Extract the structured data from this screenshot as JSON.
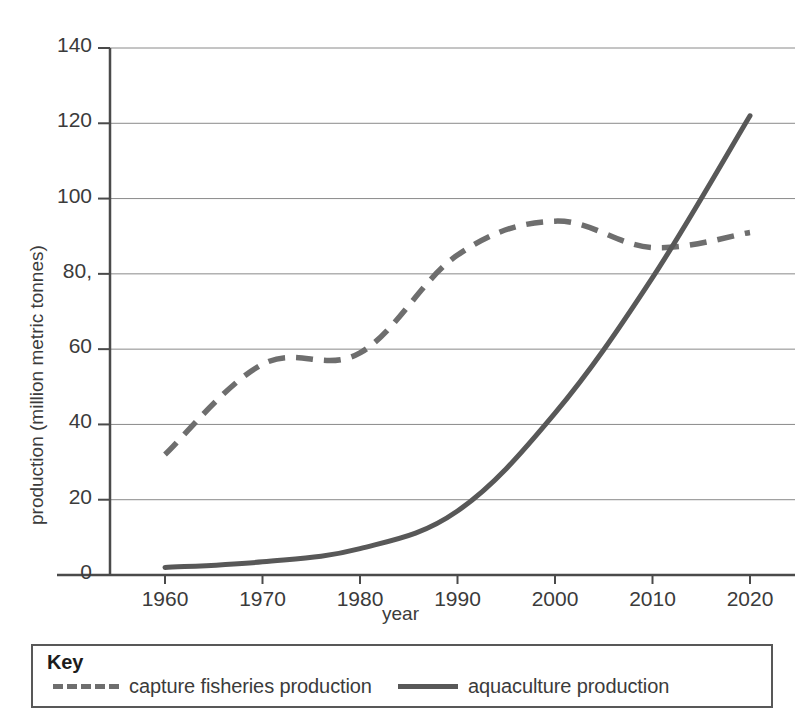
{
  "chart_data": {
    "type": "line",
    "title": "",
    "xlabel": "year",
    "ylabel": "production (million metric tonnes)",
    "x": [
      1960,
      1970,
      1980,
      1990,
      2000,
      2010,
      2020
    ],
    "xtick_labels": [
      "1960",
      "1970",
      "1980",
      "1990",
      "2000",
      "2010",
      "2020"
    ],
    "ytick_labels": [
      "0",
      "20",
      "40",
      "60",
      "80,",
      "100",
      "120",
      "140"
    ],
    "ytick_values": [
      0,
      20,
      40,
      60,
      80,
      100,
      120,
      140
    ],
    "xlim": [
      1955,
      2025
    ],
    "ylim": [
      0,
      140
    ],
    "grid": "horizontal",
    "legend_position": "below-plot",
    "series": [
      {
        "name": "capture fisheries production",
        "style": "dashed",
        "color": "#6e6e6e",
        "values": [
          32,
          56,
          59,
          85,
          94,
          87,
          91
        ]
      },
      {
        "name": "aquaculture production",
        "style": "solid",
        "color": "#585858",
        "values": [
          2,
          3.5,
          7,
          17,
          43,
          79,
          122
        ]
      }
    ]
  },
  "legend": {
    "title": "Key",
    "entries": [
      {
        "label": "capture fisheries production",
        "style": "dashed"
      },
      {
        "label": "aquaculture production",
        "style": "solid"
      }
    ]
  },
  "colors": {
    "capture_series": "#6e6e6e",
    "aquaculture_series": "#585858",
    "axis": "#4a4a4a",
    "gridline": "#8a8a8a",
    "text": "#3b3b3b"
  }
}
